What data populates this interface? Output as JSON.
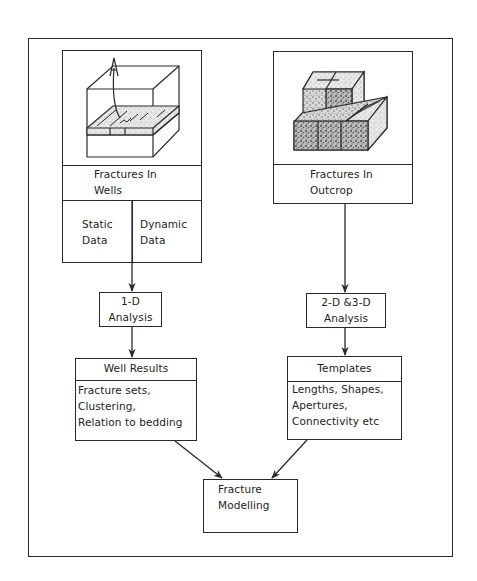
{
  "diagram": {
    "left_column": {
      "source_box": {
        "illustration": "well-block-diagram",
        "title_line1": "Fractures   In",
        "title_line2": "Wells",
        "sub_left_line1": "Static",
        "sub_left_line2": "Data",
        "sub_right_line1": "Dynamic",
        "sub_right_line2": "Data"
      },
      "analysis_box": {
        "line1": "1-D",
        "line2": "Analysis"
      },
      "results_box": {
        "header": "Well   Results",
        "items": [
          "Fracture  sets,",
          "Clustering,",
          "Relation  to  bedding"
        ]
      }
    },
    "right_column": {
      "source_box": {
        "illustration": "outcrop-blocks",
        "title_line1": "Fractures   In",
        "title_line2": "Outcrop"
      },
      "analysis_box": {
        "line1": "2-D  &3-D",
        "line2": "Analysis"
      },
      "results_box": {
        "header": "Templates",
        "items": [
          "Lengths,  Shapes,",
          "Apertures,",
          "Connectivity   etc"
        ]
      }
    },
    "sink_box": {
      "line1": "Fracture",
      "line2": "Modelling"
    },
    "colors": {
      "line": "#2a2a2a",
      "background": "#ffffff",
      "texture": "#8a8a8a"
    }
  }
}
